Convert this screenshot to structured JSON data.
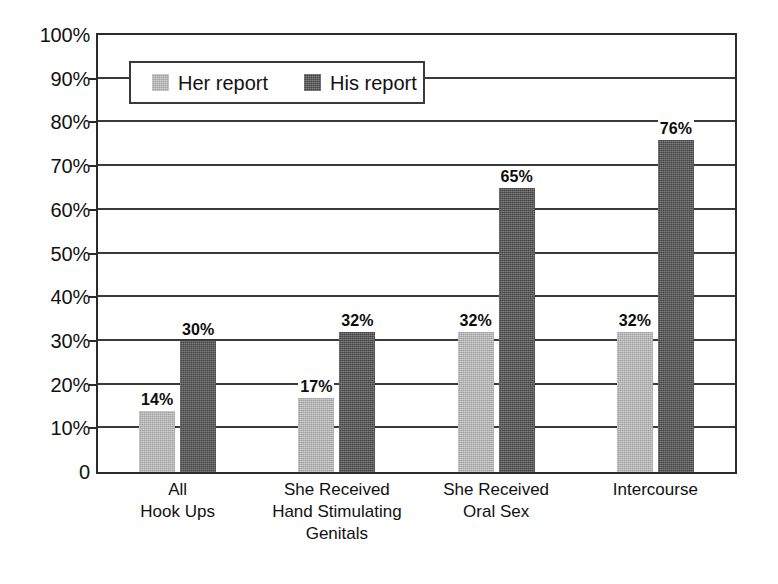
{
  "chart_data": {
    "type": "bar",
    "title": "",
    "xlabel": "",
    "ylabel": "",
    "ylim": [
      0,
      100
    ],
    "grid": true,
    "legend_position": "top-left-inside",
    "value_suffix": "%",
    "categories": [
      "All\nHook Ups",
      "She Received\nHand Stimulating\nGenitals",
      "She Received\nOral Sex",
      "Intercourse"
    ],
    "category_lines": [
      [
        "All",
        "Hook Ups"
      ],
      [
        "She Received",
        "Hand Stimulating",
        "Genitals"
      ],
      [
        "She Received",
        "Oral Sex"
      ],
      [
        "Intercourse"
      ]
    ],
    "series": [
      {
        "name": "Her report",
        "color": "#b2b2b2",
        "values": [
          14,
          17,
          32,
          32
        ],
        "labels": [
          "14%",
          "17%",
          "32%",
          "32%"
        ]
      },
      {
        "name": "His report",
        "color": "#555555",
        "values": [
          30,
          32,
          65,
          76
        ],
        "labels": [
          "30%",
          "32%",
          "65%",
          "76%"
        ]
      }
    ],
    "yticks": [
      100,
      90,
      80,
      70,
      60,
      50,
      40,
      30,
      20,
      10,
      0
    ],
    "ytick_labels": [
      "100%",
      "90%",
      "80%",
      "70%",
      "60%",
      "50%",
      "40%",
      "30%",
      "20%",
      "10%",
      "0"
    ]
  },
  "legend": {
    "entries": [
      {
        "label": "Her report",
        "color": "#b2b2b2"
      },
      {
        "label": "His report",
        "color": "#555555"
      }
    ]
  },
  "colors": {
    "her_report": "#b2b2b2",
    "his_report": "#555555",
    "axis": "#2b2b2b",
    "gridline": "#3a3a3a",
    "text": "#111111",
    "background": "#ffffff"
  }
}
